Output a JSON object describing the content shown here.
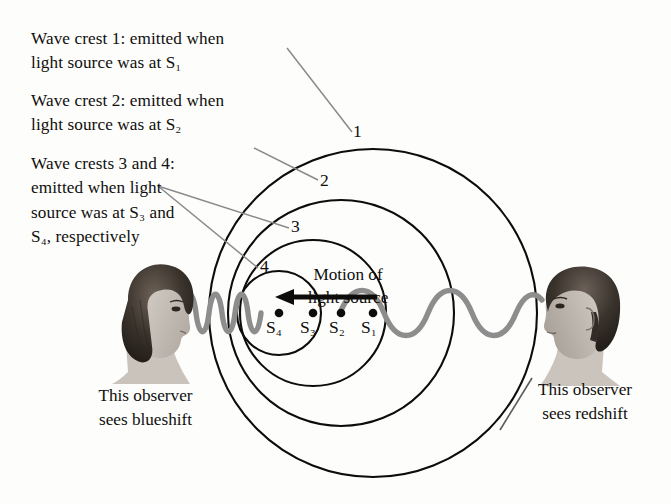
{
  "figure": {
    "background_color": "#fdfdfc",
    "ink_color": "#100f0d",
    "wave_color": "#8d8d8d",
    "leader_color": "#8a8a8a"
  },
  "callouts": [
    {
      "name": "wave-crest-1",
      "text": "Wave crest 1: emitted when\nlight source was at S₁"
    },
    {
      "name": "wave-crest-2",
      "text": "Wave crest 2: emitted when\nlight source was at S₂"
    },
    {
      "name": "wave-crests-3-and-4",
      "text": "Wave crests 3 and 4:\nemitted when light\nsource was at S₃ and\nS₄, respectively"
    }
  ],
  "crest_labels": [
    {
      "name": "crest-1",
      "label": "1"
    },
    {
      "name": "crest-2",
      "label": "2"
    },
    {
      "name": "crest-3",
      "label": "3"
    },
    {
      "name": "crest-4",
      "label": "4"
    }
  ],
  "motion": {
    "label": "Motion of\nlight source",
    "direction": "left"
  },
  "source_positions": [
    {
      "name": "source-position-4",
      "label": "S₄"
    },
    {
      "name": "source-position-3",
      "label": "S₃"
    },
    {
      "name": "source-position-2",
      "label": "S₂"
    },
    {
      "name": "source-position-1",
      "label": "S₁"
    }
  ],
  "observers": [
    {
      "name": "observer-left",
      "caption": "This observer\nsees blueshift",
      "shift": "blueshift",
      "wave_description": "compressed short-wavelength wave"
    },
    {
      "name": "observer-right",
      "caption": "This observer\nsees redshift",
      "shift": "redshift",
      "wave_description": "stretched long-wavelength wave"
    }
  ]
}
